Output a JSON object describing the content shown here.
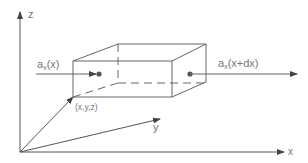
{
  "diagram": {
    "axes": {
      "x_label": "x",
      "y_label": "y",
      "z_label": "z"
    },
    "point_label": "(x,y,z)",
    "flux_in": {
      "base": "a",
      "subscript": "x",
      "arg": "(x)"
    },
    "flux_out": {
      "base": "a",
      "subscript": "x",
      "arg": "(x+dx)"
    },
    "colors": {
      "line": "#666666",
      "text": "#777777",
      "background": "#ffffff"
    }
  }
}
